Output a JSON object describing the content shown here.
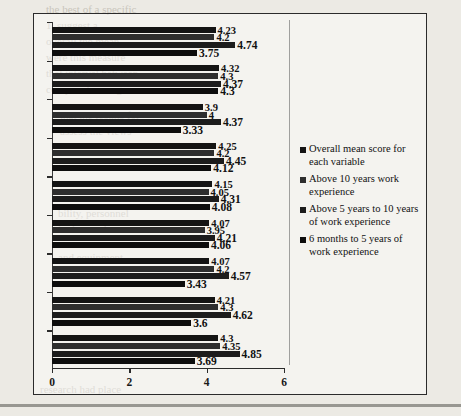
{
  "chart_data": {
    "type": "bar",
    "orientation": "horizontal",
    "title": "",
    "xlabel": "",
    "ylabel": "",
    "xlim": [
      0,
      6
    ],
    "xticks": [
      "0",
      "2",
      "4",
      "6"
    ],
    "grid": false,
    "legend_position": "right",
    "categories": [
      "Vr.1",
      "Vr.2",
      "Vr.3",
      "Vr.4",
      "Vr.5",
      "Vr.6",
      "Vr.7",
      "Vr.8",
      "Vr.9"
    ],
    "series": [
      {
        "name": "Overall mean score for each variable",
        "color": "#141414",
        "values": [
          4.3,
          4.21,
          4.07,
          4.07,
          4.15,
          4.25,
          3.9,
          4.32,
          4.23
        ]
      },
      {
        "name": "Above 10 years work experience",
        "color": "#2e2e2e",
        "values": [
          4.35,
          4.3,
          4.2,
          3.95,
          4.05,
          4.2,
          4,
          4.3,
          4.2
        ]
      },
      {
        "name": "Above 5 years to 10 years of work experience",
        "color": "#1c1c1c",
        "values": [
          4.85,
          4.62,
          4.57,
          4.21,
          4.31,
          4.45,
          4.37,
          4.37,
          4.74
        ]
      },
      {
        "name": "6 months to 5 years of work experience",
        "color": "#0d0d0d",
        "values": [
          3.69,
          3.6,
          3.43,
          4.06,
          4.08,
          4.12,
          3.33,
          4.3,
          3.75
        ]
      }
    ],
    "data_labels": {
      "Vr.9": [
        "4.23",
        "4.2",
        "4.74",
        "3.75"
      ],
      "Vr.8": [
        "4.32",
        "4.3",
        "4.37",
        "4.3"
      ],
      "Vr.7": [
        "3.9",
        "4",
        "4.37",
        "3.33"
      ],
      "Vr.6": [
        "4.25",
        "4.2",
        "4.45",
        "4.12"
      ],
      "Vr.5": [
        "4.15",
        "4.05",
        "4.31",
        "4.08"
      ],
      "Vr.4": [
        "4.07",
        "3.95",
        "4.21",
        "4.06"
      ],
      "Vr.3": [
        "4.07",
        "4.2",
        "4.57",
        "3.43"
      ],
      "Vr.2": [
        "4.21",
        "4.3",
        "4.62",
        "3.6"
      ],
      "Vr.1": [
        "4.3",
        "4.35",
        "4.85",
        "3.69"
      ]
    }
  },
  "legend": {
    "entries": [
      "Overall mean score for each variable",
      "Above 10 years work experience",
      "Above 5 years to 10 years of work experience",
      "6 months to 5 years of work experience"
    ]
  },
  "axis": {
    "x_ticks": [
      "0",
      "2",
      "4",
      "6"
    ],
    "y_ticks": [
      "Vr.9",
      "Vr.8",
      "Vr.7",
      "Vr.6",
      "Vr.5",
      "Vr.4",
      "Vr.3",
      "Vr.2",
      "Vr.1"
    ]
  }
}
